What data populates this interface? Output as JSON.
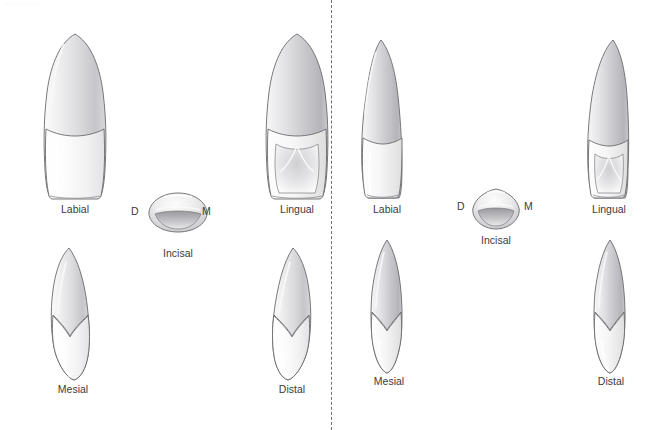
{
  "figure": {
    "corner_mark": "Anterior teeth",
    "divider": {
      "x": 331,
      "style": "dashed",
      "color": "#6f6f72"
    },
    "groups": [
      {
        "name": "maxillary-central-incisor",
        "views": [
          {
            "key": "labial",
            "label": "Labial",
            "shape": "central-incisor-facial",
            "x": 34,
            "y": 34,
            "w": 82,
            "h": 166,
            "label_x": 41,
            "label_y": 203,
            "label_w": 68
          },
          {
            "key": "incisal",
            "label": "Incisal",
            "shape": "central-incisor-incisal",
            "x": 148,
            "y": 193,
            "w": 60,
            "h": 39,
            "label_x": 144,
            "label_y": 247,
            "label_w": 68
          },
          {
            "key": "lingual",
            "label": "Lingual",
            "shape": "central-incisor-lingual",
            "x": 256,
            "y": 34,
            "w": 82,
            "h": 166,
            "label_x": 263,
            "label_y": 203,
            "label_w": 68
          },
          {
            "key": "mesial",
            "label": "Mesial",
            "shape": "central-incisor-mesial",
            "x": 38,
            "y": 248,
            "w": 70,
            "h": 132,
            "label_x": 39,
            "label_y": 383,
            "label_w": 68
          },
          {
            "key": "distal",
            "label": "Distal",
            "shape": "central-incisor-distal",
            "x": 258,
            "y": 248,
            "w": 70,
            "h": 132,
            "label_x": 258,
            "label_y": 383,
            "label_w": 68
          }
        ],
        "surface_letters": [
          {
            "key": "distal-letter",
            "text": "D",
            "x": 131,
            "y": 205
          },
          {
            "key": "mesial-letter",
            "text": "M",
            "x": 202,
            "y": 205
          }
        ]
      },
      {
        "name": "maxillary-lateral-incisor",
        "views": [
          {
            "key": "labial",
            "label": "Labial",
            "shape": "lateral-incisor-facial",
            "x": 357,
            "y": 40,
            "w": 60,
            "h": 160,
            "label_x": 353,
            "label_y": 203,
            "label_w": 68
          },
          {
            "key": "incisal",
            "label": "Incisal",
            "shape": "lateral-incisor-incisal",
            "x": 472,
            "y": 189,
            "w": 48,
            "h": 40,
            "label_x": 462,
            "label_y": 234,
            "label_w": 68
          },
          {
            "key": "lingual",
            "label": "Lingual",
            "shape": "lateral-incisor-lingual",
            "x": 578,
            "y": 40,
            "w": 60,
            "h": 160,
            "label_x": 575,
            "label_y": 203,
            "label_w": 68
          },
          {
            "key": "mesial",
            "label": "Mesial",
            "shape": "lateral-incisor-mesial",
            "x": 361,
            "y": 240,
            "w": 54,
            "h": 133,
            "label_x": 355,
            "label_y": 375,
            "label_w": 68
          },
          {
            "key": "distal",
            "label": "Distal",
            "shape": "lateral-incisor-distal",
            "x": 583,
            "y": 240,
            "w": 54,
            "h": 133,
            "label_x": 577,
            "label_y": 375,
            "label_w": 68
          }
        ],
        "surface_letters": [
          {
            "key": "distal-letter",
            "text": "D",
            "x": 457,
            "y": 200
          },
          {
            "key": "mesial-letter",
            "text": "M",
            "x": 524,
            "y": 200
          }
        ]
      }
    ],
    "colors": {
      "outline": "#6a6a6d",
      "enamel_light": "#fdfdfd",
      "enamel_shadow": "#e4e4e6",
      "root_light": "#efeff0",
      "root_mid": "#d8d8da",
      "root_dark": "#b9b9bd",
      "label_text": "#3b3b3e",
      "background": "#ffffff"
    }
  }
}
